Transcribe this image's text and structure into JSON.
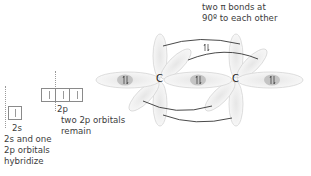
{
  "diagram": {
    "topic": "sp hybridization in a carbon–carbon triple bond",
    "labels": {
      "pi_bonds_line1": "two π bonds at",
      "pi_bonds_line2": "90º to each other",
      "orbital_2s": "2s",
      "orbital_2p": "2p",
      "remain_line1": "two 2p orbitals",
      "remain_line2": "remain",
      "hybridize_line1": "2s and one",
      "hybridize_line2": "2p orbitals",
      "hybridize_line3": "hybridize",
      "carbon_1": "C",
      "carbon_2": "C"
    },
    "orbital_boxes": {
      "2s": {
        "count": 1,
        "electrons": "single-up"
      },
      "2p": {
        "count": 3,
        "electrons": "single-up each"
      }
    },
    "electron_pairs": [
      "left sp lobe",
      "C–C sigma bond",
      "right sp lobe",
      "upper pi bond"
    ],
    "colors": {
      "lobe_fill": "#f2f2f2",
      "lobe_stroke": "#cfcfcf",
      "overlap_fill": "#bdbdbd",
      "curve_stroke": "#4a4a4a",
      "text": "#3c3c3c"
    }
  }
}
